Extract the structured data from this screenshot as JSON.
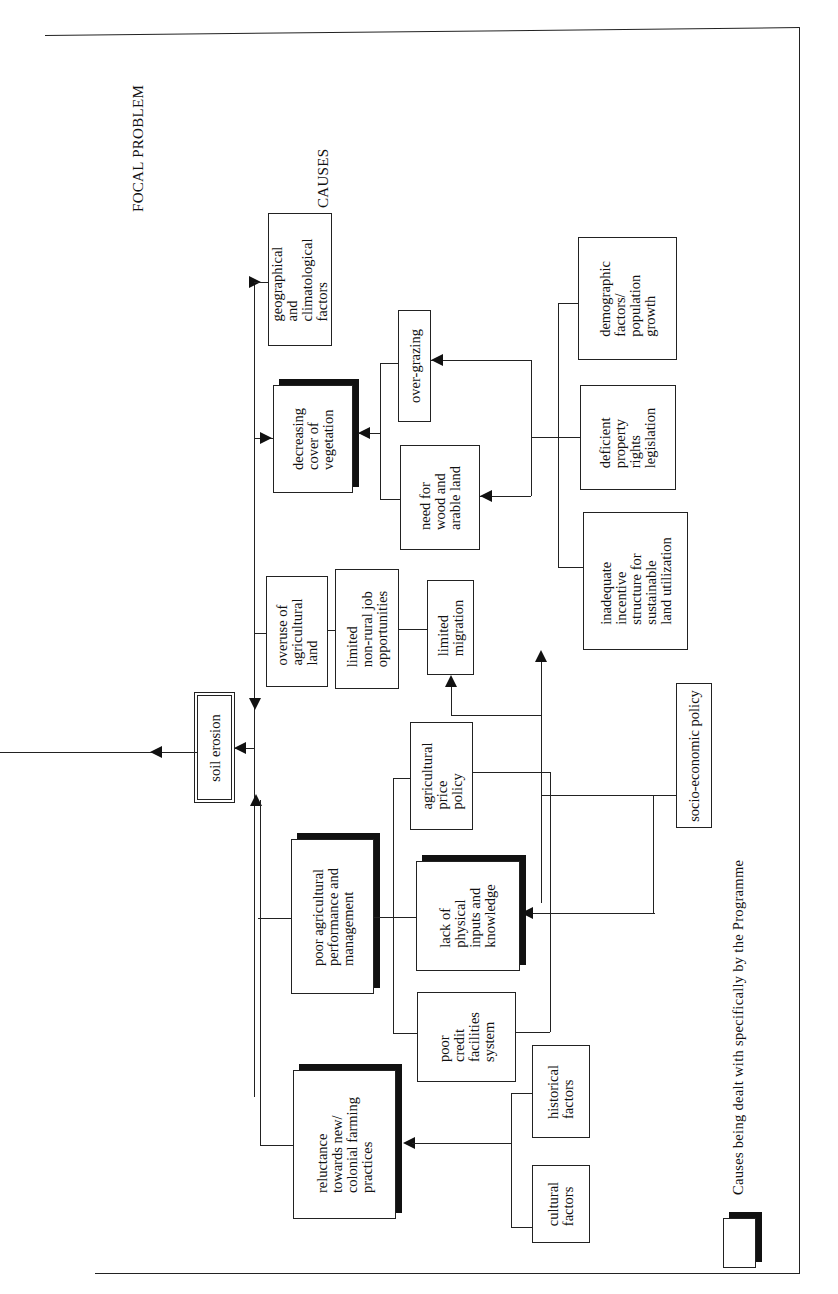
{
  "labels": {
    "focal_problem": "FOCAL PROBLEM",
    "causes": "CAUSES"
  },
  "focal": {
    "label": "soil erosion"
  },
  "nodes": {
    "geo": "geographical\nand\nclimatological\nfactors",
    "veg": "decreasing\ncover of\nvegetation",
    "overgrazing": "over-grazing",
    "wood": "need for\nwood and\narable land",
    "demographic": "demographic\nfactors/\npopulation\ngrowth",
    "property": "deficient\nproperty\nrights\nlegislation",
    "incentive": "inadequate\nincentive\nstructure for\nsustainable\nland utilization",
    "overuse": "overuse of\nagricultural\nland",
    "jobs": "limited\nnon-rural job\nopportunities",
    "migration": "limited\nmigration",
    "price": "agricultural\nprice\npolicy",
    "socio": "socio-economic policy",
    "poor_agri": "poor agricultural\nperformance and\nmanagement",
    "lack": "lack of\nphysical\ninputs and\nknowledge",
    "credit": "poor\ncredit\nfacilities\nsystem",
    "reluctance": "reluctance\ntowards new/\ncolonial farming\npractices",
    "historical": "historical\nfactors",
    "cultural": "cultural\nfactors"
  },
  "legend": {
    "text": "Causes being dealt with specifically by the Programme"
  }
}
